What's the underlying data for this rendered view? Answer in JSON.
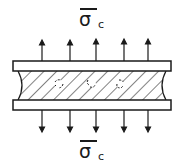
{
  "diagram": {
    "top_stress_label": {
      "symbol": "σ",
      "subscript": "c",
      "overbar": true
    },
    "bottom_stress_label": {
      "symbol": "σ",
      "subscript": "c",
      "overbar": true
    },
    "arrows": {
      "count_top": 5,
      "count_bottom": 5,
      "direction_top": "up",
      "direction_bottom": "down",
      "x_positions": [
        42,
        70,
        96,
        124,
        148
      ]
    },
    "plates": [
      {
        "name": "top-plate",
        "x": 13,
        "y": 61,
        "width": 158,
        "height": 10
      },
      {
        "name": "bottom-plate",
        "x": 13,
        "y": 100,
        "width": 158,
        "height": 10
      }
    ],
    "layer": {
      "fill": "diagonal-hatch",
      "edges": "concave",
      "voids": 3
    },
    "colors": {
      "stroke": "#1a1a1a",
      "background": "#ffffff"
    }
  }
}
